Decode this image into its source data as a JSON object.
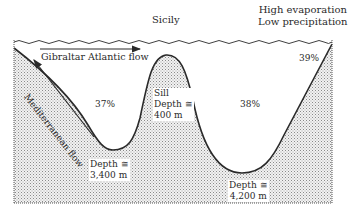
{
  "diagram": {
    "surface_labels": {
      "location": "Sicily",
      "climate_line1": "High evaporation",
      "climate_line2": "Low precipitation"
    },
    "flows": {
      "atlantic": "Gibraltar Atlantic flow",
      "mediterranean": "Mediterranean flow"
    },
    "basins": {
      "western_percent": "37%",
      "eastern_percent": "38%",
      "shelf_percent": "39%",
      "western_depth_line1": "Depth ≅",
      "western_depth_line2": "3,400 m",
      "eastern_depth_line1": "Depth ≅",
      "eastern_depth_line2": "4,200 m"
    },
    "sill": {
      "title": "Sill",
      "depth_line1": "Depth ≅",
      "depth_line2": "400 m"
    },
    "colors": {
      "line": "#2a2a2a",
      "stipple": "#9a9a9a",
      "water": "#ffffff"
    }
  }
}
